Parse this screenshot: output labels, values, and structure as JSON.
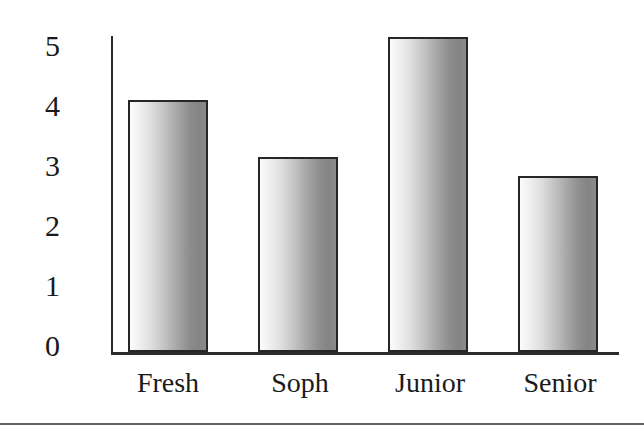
{
  "chart_data": {
    "type": "bar",
    "title": "",
    "subtitle": "",
    "xlabel": "",
    "ylabel": "",
    "categories": [
      "Fresh",
      "Soph",
      "Junior",
      "Senior"
    ],
    "values": [
      4.0,
      3.1,
      5.0,
      2.8
    ],
    "series": [
      {
        "name": "",
        "values": [
          4.0,
          3.1,
          5.0,
          2.8
        ]
      }
    ],
    "ylim": [
      0,
      5
    ],
    "yticks": [
      "5",
      "4",
      "3",
      "2",
      "1",
      "0"
    ],
    "ytick_values": [
      5,
      4,
      3,
      2,
      1,
      0
    ],
    "grid": false,
    "legend": false,
    "legend_position": "none",
    "annotations": [],
    "bar_fill": "linear-gradient light-to-dark gray",
    "bar_edge_color": "#262626",
    "axis_color": "#2b2b2b",
    "background_color": "#ffffff"
  },
  "axes": {
    "y_ticks": [
      {
        "label": "5",
        "value": 5
      },
      {
        "label": "4",
        "value": 4
      },
      {
        "label": "3",
        "value": 3
      },
      {
        "label": "2",
        "value": 2
      },
      {
        "label": "1",
        "value": 1
      },
      {
        "label": "0",
        "value": 0
      }
    ],
    "x_ticks": [
      {
        "label": "Fresh"
      },
      {
        "label": "Soph"
      },
      {
        "label": "Junior"
      },
      {
        "label": "Senior"
      }
    ]
  },
  "bars": [
    {
      "category": "Fresh",
      "value": 4.0
    },
    {
      "category": "Soph",
      "value": 3.1
    },
    {
      "category": "Junior",
      "value": 5.0
    },
    {
      "category": "Senior",
      "value": 2.8
    }
  ]
}
